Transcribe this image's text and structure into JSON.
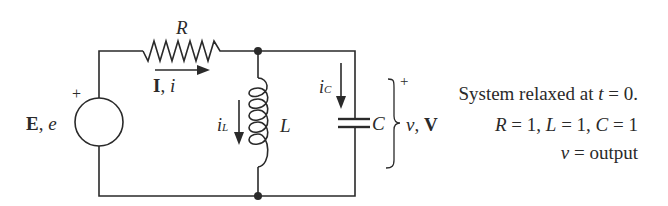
{
  "diagram": {
    "type": "circuit",
    "components": {
      "resistor": {
        "label": "R"
      },
      "inductor": {
        "label": "L"
      },
      "capacitor": {
        "label": "C"
      },
      "source": {
        "label_bold": "E",
        "label_sep": ",",
        "label_italic": "e",
        "polarity": "+"
      }
    },
    "currents": {
      "main": {
        "bold": "I",
        "sep": ",",
        "italic": "i"
      },
      "inductor": {
        "base": "i",
        "sub": "L"
      },
      "capacitor": {
        "base": "i",
        "sub": "C"
      }
    },
    "output_voltage": {
      "italic": "v",
      "sep": ",",
      "bold": "V",
      "polarity": "+"
    },
    "notes": {
      "line1_prefix": "System relaxed at ",
      "line1_var": "t",
      "line1_suffix": " = 0.",
      "line2": {
        "R_name": "R",
        "R_val": " = 1, ",
        "L_name": "L",
        "L_val": " = 1, ",
        "C_name": "C",
        "C_val": " = 1"
      },
      "line3_var": "v",
      "line3_suffix": " = output"
    },
    "colors": {
      "ink": "#2a2a2a",
      "background": "#ffffff"
    }
  }
}
